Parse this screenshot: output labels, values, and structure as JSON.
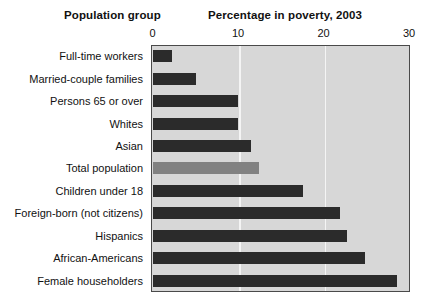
{
  "headers": {
    "left": "Population group",
    "right": "Percentage in poverty, 2003"
  },
  "chart_data": {
    "type": "bar",
    "orientation": "horizontal",
    "title": "Percentage in poverty, 2003",
    "xlabel": "",
    "ylabel": "Population group",
    "xlim": [
      0,
      30
    ],
    "xticks": [
      0,
      10,
      20,
      30
    ],
    "xtick_labels": [
      "0",
      "10",
      "20",
      "30"
    ],
    "grid": true,
    "gridlines_at": [
      10,
      20
    ],
    "legend": null,
    "categories": [
      "Full-time workers",
      "Married-couple families",
      "Persons 65 or over",
      "Whites",
      "Asian",
      "Total population",
      "Children under 18",
      "Foreign-born (not citizens)",
      "Hispanics",
      "African-Americans",
      "Female householders"
    ],
    "values": [
      2.3,
      5.1,
      10.0,
      10.0,
      11.5,
      12.5,
      17.6,
      21.9,
      22.7,
      24.9,
      28.6
    ],
    "highlight_index": 5,
    "colors": {
      "bar": "#2b2b2b",
      "bar_highlight": "#818181",
      "plot_background": "#d7d7d7",
      "gridline": "#f4f4f4",
      "frame": "#4a4a4a"
    }
  }
}
